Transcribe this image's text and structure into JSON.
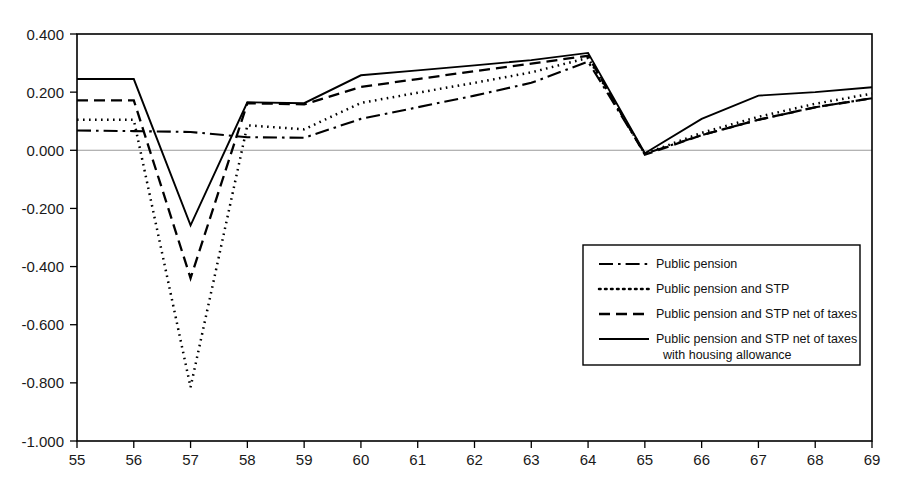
{
  "chart_data": {
    "type": "line",
    "title": "",
    "subtitle": "",
    "xlabel": "",
    "ylabel": "",
    "grid": false,
    "legend_position": "inside-right",
    "x": [
      55,
      56,
      57,
      58,
      59,
      60,
      61,
      62,
      63,
      64,
      65,
      66,
      67,
      68,
      69
    ],
    "xlim": [
      55,
      69
    ],
    "ylim": [
      -1.0,
      0.4
    ],
    "xticks": [
      "55",
      "56",
      "57",
      "58",
      "59",
      "60",
      "61",
      "62",
      "63",
      "64",
      "65",
      "66",
      "67",
      "68",
      "69"
    ],
    "yticks": [
      "0.400",
      "0.200",
      "0.000",
      "-0.200",
      "-0.400",
      "-0.600",
      "-0.800",
      "-1.000"
    ],
    "ytick_values": [
      0.4,
      0.2,
      0.0,
      -0.2,
      -0.4,
      -0.6,
      -0.8,
      -1.0
    ],
    "zero_line": 0.0,
    "series": [
      {
        "name": "Public pension",
        "style": "dashdot",
        "values": [
          0.068,
          0.066,
          0.063,
          0.045,
          0.043,
          0.108,
          0.148,
          0.188,
          0.232,
          0.305,
          -0.012,
          0.052,
          0.105,
          0.148,
          0.179
        ]
      },
      {
        "name": "Public pension and STP",
        "style": "dotted",
        "values": [
          0.105,
          0.105,
          -0.815,
          0.086,
          0.072,
          0.163,
          0.198,
          0.232,
          0.268,
          0.318,
          -0.012,
          0.06,
          0.115,
          0.16,
          0.195
        ]
      },
      {
        "name": "Public pension and STP net of taxes",
        "style": "dashed",
        "values": [
          0.172,
          0.172,
          -0.44,
          0.162,
          0.158,
          0.218,
          0.245,
          0.272,
          0.298,
          0.325,
          -0.015,
          0.052,
          0.105,
          0.148,
          0.179
        ]
      },
      {
        "name": "Public pension and STP net of taxes with housing allowance",
        "style": "solid",
        "values": [
          0.245,
          0.245,
          -0.258,
          0.165,
          0.162,
          0.258,
          0.275,
          0.292,
          0.31,
          0.335,
          -0.01,
          0.108,
          0.188,
          0.2,
          0.217
        ]
      }
    ],
    "legend_entries": [
      {
        "label": "Public pension",
        "style": "dashdot",
        "line2": ""
      },
      {
        "label": "Public pension and STP",
        "style": "dotted",
        "line2": ""
      },
      {
        "label": "Public pension and STP net of taxes",
        "style": "dashed",
        "line2": ""
      },
      {
        "label": "Public pension and STP net of taxes",
        "style": "solid",
        "line2": "with housing allowance"
      }
    ],
    "colors": {
      "series_stroke": "#000000",
      "axis": "#000000",
      "zero_line": "#9a9a9a",
      "background": "#ffffff",
      "text": "#111111"
    }
  }
}
